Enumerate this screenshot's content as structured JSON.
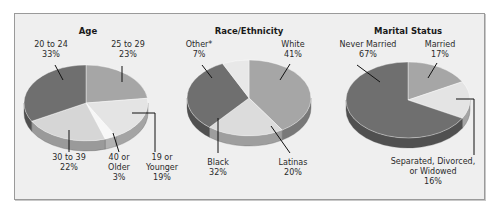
{
  "chart_data": [
    {
      "type": "pie",
      "title": "Age",
      "slices": [
        {
          "label": "25 to 29",
          "value": 23,
          "color": "#a6a6a6"
        },
        {
          "label": "19 or Younger",
          "value": 19,
          "color": "#e4e4e4"
        },
        {
          "label": "40 or Older",
          "value": 3,
          "color": "#f7f7f7"
        },
        {
          "label": "30 to 39",
          "value": 22,
          "color": "#d6d6d6"
        },
        {
          "label": "20 to 24",
          "value": 33,
          "color": "#6f6f6f"
        }
      ],
      "labels": [
        {
          "lines": [
            "25 to 29",
            "23%"
          ]
        },
        {
          "lines": [
            "19 or",
            "Younger",
            "19%"
          ]
        },
        {
          "lines": [
            "40 or",
            "Older",
            "3%"
          ]
        },
        {
          "lines": [
            "30 to 39",
            "22%"
          ]
        },
        {
          "lines": [
            "20 to 24",
            "33%"
          ]
        }
      ]
    },
    {
      "type": "pie",
      "title": "Race/Ethnicity",
      "slices": [
        {
          "label": "White",
          "value": 41,
          "color": "#a6a6a6"
        },
        {
          "label": "Latinas",
          "value": 20,
          "color": "#dcdcdc"
        },
        {
          "label": "Black",
          "value": 32,
          "color": "#6f6f6f"
        },
        {
          "label": "Other*",
          "value": 7,
          "color": "#e8e8e8"
        }
      ],
      "labels": [
        {
          "lines": [
            "White",
            "41%"
          ]
        },
        {
          "lines": [
            "Latinas",
            "20%"
          ]
        },
        {
          "lines": [
            "Black",
            "32%"
          ]
        },
        {
          "lines": [
            "Other*",
            "7%"
          ]
        }
      ]
    },
    {
      "type": "pie",
      "title": "Marital Status",
      "slices": [
        {
          "label": "Married",
          "value": 17,
          "color": "#a6a6a6"
        },
        {
          "label": "Separated, Divorced, or Widowed",
          "value": 16,
          "color": "#e4e4e4"
        },
        {
          "label": "Never Married",
          "value": 67,
          "color": "#6f6f6f"
        }
      ],
      "labels": [
        {
          "lines": [
            "Married",
            "17%"
          ]
        },
        {
          "lines": [
            "Separated, Divorced,",
            "or Widowed",
            "16%"
          ]
        },
        {
          "lines": [
            "Never Married",
            "67%"
          ]
        }
      ]
    }
  ]
}
